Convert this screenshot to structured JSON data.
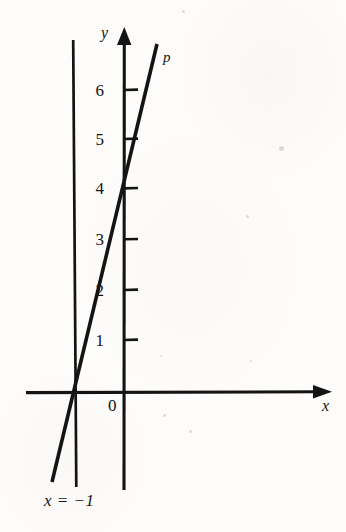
{
  "figure": {
    "kind": "cartesian-line-graph",
    "background_color": "#fdfcfa",
    "ink_color": "#141414",
    "width": 346,
    "height": 532
  },
  "axes": {
    "x_axis_label": "x",
    "y_axis_label": "y",
    "origin_label": "0",
    "x_axis_pixel_y": 392,
    "y_axis_pixel_x": 124,
    "x_axis_start_px": 26,
    "x_axis_arrow_tip_px": 332,
    "y_axis_arrow_tip_px": 28,
    "y_axis_bottom_px": 490,
    "tick_spacing_px": 50.3
  },
  "y_ticks": [
    {
      "label": "1",
      "value": 1,
      "py": 340
    },
    {
      "label": "2",
      "value": 2,
      "py": 290
    },
    {
      "label": "3",
      "value": 3,
      "py": 239
    },
    {
      "label": "4",
      "value": 4,
      "py": 188
    },
    {
      "label": "5",
      "value": 5,
      "py": 139
    },
    {
      "label": "6",
      "value": 6,
      "py": 90
    }
  ],
  "lines": [
    {
      "name": "line-p",
      "label": "p",
      "label_px": {
        "x": 163,
        "y": 50
      },
      "x_intercept": -1,
      "y_intercept": 4,
      "slope": 4,
      "endpoints_px": {
        "x1": 52,
        "y1": 482,
        "x2": 157,
        "y2": 44
      },
      "stroke_width": 3.4
    },
    {
      "name": "vertical-line-x-equals-minus-1",
      "label": "x = −1",
      "label_px": {
        "x": 44,
        "y": 492
      },
      "x_value": -1,
      "endpoints_px": {
        "x1": 73,
        "y1": 40,
        "x2": 76,
        "y2": 487
      },
      "stroke_width": 2.6
    }
  ],
  "chart_data": {
    "type": "line",
    "title": "",
    "subtitle": "",
    "xlabel": "x",
    "ylabel": "y",
    "grid": false,
    "legend_position": "inline-labels",
    "xlim": [
      -2,
      4.2
    ],
    "ylim": [
      -2,
      7.3
    ],
    "x_tick_labels": [
      "0"
    ],
    "y_tick_labels": [
      "1",
      "2",
      "3",
      "4",
      "5",
      "6"
    ],
    "y_tick_values": [
      1,
      2,
      3,
      4,
      5,
      6
    ],
    "annotations": [
      {
        "text": "p",
        "x": 0.8,
        "y": 7.2
      },
      {
        "text": "x = −1",
        "x": -1.1,
        "y": -2.0
      },
      {
        "text": "0",
        "x": -0.25,
        "y": -0.25
      }
    ],
    "series": [
      {
        "name": "p",
        "type": "line",
        "equation": "y = 4x + 4",
        "slope": 4,
        "y_intercept": 4,
        "x_intercept": -1,
        "x": [
          -1.45,
          0,
          0.65
        ],
        "values": [
          -1.8,
          4,
          6.6
        ],
        "key_points": [
          {
            "x": -1,
            "y": 0,
            "note": "x-intercept"
          },
          {
            "x": 0,
            "y": 4,
            "note": "y-intercept"
          }
        ]
      },
      {
        "name": "x = −1",
        "type": "vertical-line",
        "equation": "x = −1",
        "x": [
          -1,
          -1
        ],
        "values": [
          7.0,
          -1.9
        ]
      }
    ]
  },
  "specks": [
    {
      "x": 182,
      "y": 10,
      "d": 3
    },
    {
      "x": 279,
      "y": 146,
      "d": 5
    },
    {
      "x": 246,
      "y": 215,
      "d": 3
    },
    {
      "x": 163,
      "y": 414,
      "d": 3
    },
    {
      "x": 189,
      "y": 430,
      "d": 3
    },
    {
      "x": 160,
      "y": 355,
      "d": 2
    },
    {
      "x": 250,
      "y": 360,
      "d": 2
    }
  ]
}
